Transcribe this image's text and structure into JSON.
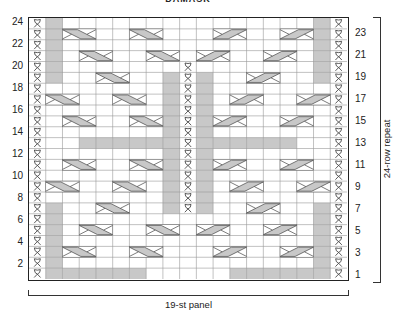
{
  "title": "DAMASK",
  "left_row_labels": [
    "24",
    "22",
    "20",
    "18",
    "16",
    "14",
    "12",
    "10",
    "8",
    "6",
    "4",
    "2"
  ],
  "right_row_labels": [
    "23",
    "21",
    "19",
    "17",
    "15",
    "13",
    "11",
    "9",
    "7",
    "5",
    "3",
    "1"
  ],
  "repeat_label": "24-row repeat",
  "panel_label": "19-st panel",
  "colors": {
    "gray": "#c8c8c8",
    "line": "#999999",
    "border": "#222222"
  },
  "legend_codes": {
    "T": "twisted-stitch",
    "G": "purl-gray",
    ".": "knit-white",
    "L": "left-cable-start",
    "R": "right-cable-start",
    "-": "cable-continuation"
  },
  "chart_data": {
    "type": "table",
    "title": "DAMASK",
    "columns": 19,
    "rows_count": 24,
    "rows_top_to_bottom": [
      "TG...............GT",
      "TGL-.L-....R-.R-.GT",
      "TG...............GT",
      "TG.L-.L-..R-.R-..GT",
      "TG.......T.......GT",
      "TG..L-..GTG..R-..GT",
      "T.......GTG.......T",
      "TL-..L-.GTG.R-..R-T",
      "T.......GTG.......T",
      "T.L-..L-GTG..R-..R-T",
      "T.......GTG.......T",
      "T..GGGGGGTGGGGGG..T",
      "T.......GTG.......T",
      "T.L-..L-GTGR-..R-.T",
      "T.......GTG.......T",
      "TL-..L-.GTG.R-..R-T",
      "T.......GTG.......T",
      "TG..L-..GTG..R-..GT",
      "TG...............GT",
      "TG.L-..L-R-..R-..GT",
      "TG...............GT",
      "TGL-..L-....R-..R-GT",
      "TG...............GT",
      "TGGGGGG.....GGGGGGT"
    ]
  }
}
